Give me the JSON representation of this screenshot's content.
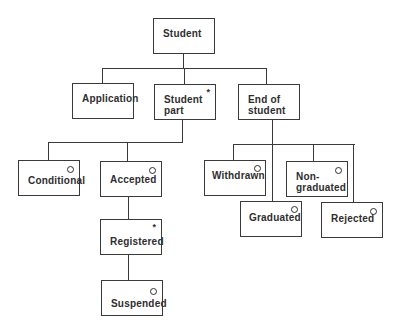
{
  "diagram": {
    "title": "Student",
    "nodes": [
      {
        "id": "student",
        "label": "Student",
        "marker": ""
      },
      {
        "id": "application",
        "label": "Application",
        "marker": ""
      },
      {
        "id": "student-part",
        "label": "Student\npart",
        "marker": "*"
      },
      {
        "id": "end-of-student",
        "label": "End of\nstudent",
        "marker": ""
      },
      {
        "id": "conditional",
        "label": "Conditional",
        "marker": "o"
      },
      {
        "id": "accepted",
        "label": "Accepted",
        "marker": "o"
      },
      {
        "id": "registered",
        "label": "Registered",
        "marker": "*"
      },
      {
        "id": "suspended",
        "label": "Suspended",
        "marker": "o"
      },
      {
        "id": "withdrawn",
        "label": "Withdrawn",
        "marker": "o"
      },
      {
        "id": "non-graduated",
        "label": "Non-\ngraduated",
        "marker": "o"
      },
      {
        "id": "graduated",
        "label": "Graduated",
        "marker": "o"
      },
      {
        "id": "rejected",
        "label": "Rejected",
        "marker": "o"
      }
    ],
    "edges": [
      [
        "student",
        "application"
      ],
      [
        "student",
        "student-part"
      ],
      [
        "student",
        "end-of-student"
      ],
      [
        "student-part",
        "conditional"
      ],
      [
        "student-part",
        "accepted"
      ],
      [
        "accepted",
        "registered"
      ],
      [
        "registered",
        "suspended"
      ],
      [
        "end-of-student",
        "withdrawn"
      ],
      [
        "end-of-student",
        "graduated"
      ],
      [
        "end-of-student",
        "non-graduated"
      ],
      [
        "end-of-student",
        "rejected"
      ]
    ],
    "labels": {
      "student": "Student",
      "application": "Application",
      "student_part": "Student\npart",
      "end_of_student": "End of\nstudent",
      "conditional": "Conditional",
      "accepted": "Accepted",
      "registered": "Registered",
      "suspended": "Suspended",
      "withdrawn": "Withdrawn",
      "non_graduated": "Non-\ngraduated",
      "graduated": "Graduated",
      "rejected": "Rejected"
    },
    "markers": {
      "sequence": "*",
      "selection": "o"
    }
  }
}
